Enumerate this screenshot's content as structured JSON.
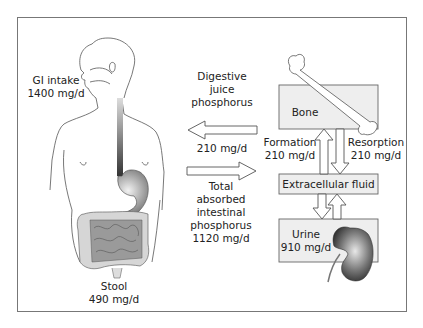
{
  "diagram": {
    "gi_intake": {
      "label": "GI intake",
      "value": "1400 mg/d"
    },
    "digestive_juice": {
      "line1": "Digestive",
      "line2": "juice",
      "line3": "phosphorus",
      "value": "210 mg/d"
    },
    "absorbed": {
      "line1": "Total",
      "line2": "absorbed",
      "line3": "intestinal",
      "line4": "phosphorus",
      "value": "1120 mg/d"
    },
    "stool": {
      "label": "Stool",
      "value": "490 mg/d"
    },
    "bone": {
      "label": "Bone"
    },
    "formation": {
      "label": "Formation",
      "value": "210 mg/d"
    },
    "resorption": {
      "label": "Resorption",
      "value": "210 mg/d"
    },
    "ecf": {
      "label": "Extracellular fluid"
    },
    "urine": {
      "label": "Urine",
      "value": "910 mg/d"
    }
  }
}
